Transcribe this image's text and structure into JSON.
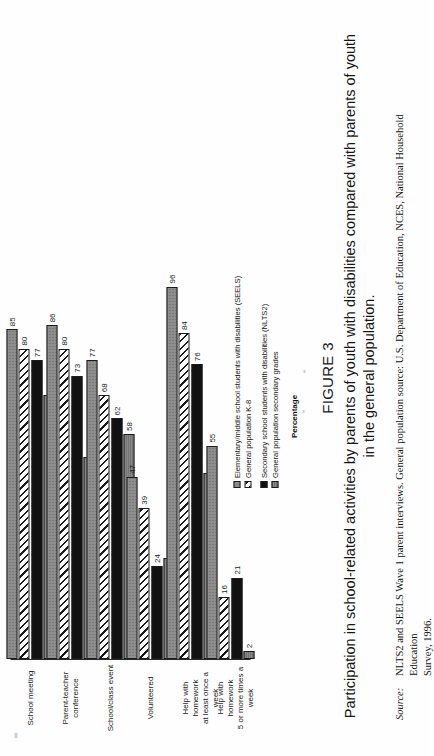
{
  "figure": {
    "number_label": "FIGURE 3",
    "caption": "Participation in school-related activities by parents of youth with disabilities compared with parents of youth in the general population.",
    "source_label": "Source:",
    "source_line1": "NLTS2 and SEELS Wave 1 parent interviews. General population source: U.S. Department of Education, NCES, National Household Education",
    "source_line2": "Survey, 1996."
  },
  "axis": {
    "x_title": "Percentage"
  },
  "legend": {
    "column1": [
      {
        "label": "Elementary/middle school students with disabilities (SEELS)",
        "swatch": "stipple-gray-swatch"
      },
      {
        "label": "General population K-8",
        "swatch": "white-hatch-swatch"
      }
    ],
    "column2": [
      {
        "label": "Secondary school students with disabilities (NLTS2)",
        "swatch": "solid-black-swatch"
      },
      {
        "label": "General population secondary grades",
        "swatch": "solid-gray-swatch"
      }
    ]
  },
  "chart_data": {
    "type": "bar",
    "orientation": "horizontal",
    "title": "Participation in school-related activities by parents of youth with disabilities compared with parents of youth in the general population.",
    "xlabel": "Percentage",
    "ylabel": "",
    "xlim": [
      0,
      100
    ],
    "grid": false,
    "legend_position": "below-plot",
    "categories": [
      "School meeting",
      "Parent-teacher conference",
      "School/class event",
      "Volunteered",
      "Help with homework at least once a week",
      "Help with homework 5 or more times a week"
    ],
    "series": [
      {
        "name": "Elementary/middle school students with disabilities (SEELS)",
        "values": [
          85,
          86,
          77,
          47,
          96,
          55
        ]
      },
      {
        "name": "General population K-8",
        "values": [
          80,
          80,
          68,
          39,
          84,
          16
        ]
      },
      {
        "name": "Secondary school students with disabilities (NLTS2)",
        "values": [
          77,
          73,
          62,
          24,
          76,
          21
        ]
      },
      {
        "name": "General population secondary grades",
        "values": [
          68,
          52,
          58,
          26,
          48,
          2
        ]
      }
    ]
  }
}
